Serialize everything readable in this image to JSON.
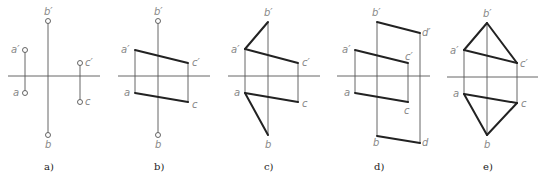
{
  "figures": [
    {
      "id": "a",
      "caption": "a)",
      "labels": {
        "b1": "b′",
        "a1": "a′",
        "c1": "c′",
        "a": "a",
        "c": "c",
        "b": "b"
      }
    },
    {
      "id": "b",
      "caption": "b)",
      "labels": {
        "b1": "b′",
        "a1": "a′",
        "c1": "c′",
        "a": "a",
        "c": "c",
        "b": "b"
      }
    },
    {
      "id": "c",
      "caption": "c)",
      "labels": {
        "b1": "b′",
        "a1": "a′",
        "c1": "c′",
        "a": "a",
        "c": "c",
        "b": "b"
      }
    },
    {
      "id": "d",
      "caption": "d)",
      "labels": {
        "b1": "b′",
        "d1": "d′",
        "a1": "a′",
        "c1": "c′",
        "a": "a",
        "c": "c",
        "b": "b",
        "d": "d"
      }
    },
    {
      "id": "e",
      "caption": "e)",
      "labels": {
        "b1": "b′",
        "a1": "a′",
        "c1": "c′",
        "a": "a",
        "c": "c",
        "b": "b"
      }
    }
  ]
}
